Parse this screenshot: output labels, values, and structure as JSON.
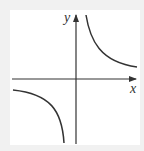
{
  "figure": {
    "x_label": "x",
    "y_label": "y",
    "colors": {
      "curve": "#333333",
      "axis": "#333333",
      "background": "#ffffff",
      "frame": "#f1f1f1"
    }
  }
}
